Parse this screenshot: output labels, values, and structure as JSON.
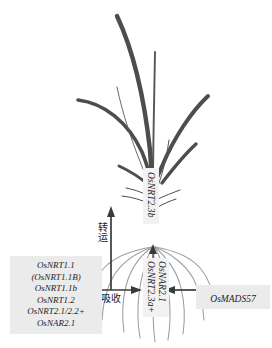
{
  "figure": {
    "colors": {
      "leaf_dark": "#4d4d4d",
      "leaf_thin": "#555555",
      "root_gray": "#9a9a9a",
      "arrow": "#3a3a3a",
      "label_bg": "#f2f2f2",
      "box_bg": "#ebebeb",
      "text": "#1d1d1d"
    }
  },
  "gene_box": {
    "name": "uptake-gene-list",
    "genes": [
      "OsNRT1.1",
      "(OsNRT1.1B)",
      "OsNRT1.1b",
      "OsNRT1.2",
      "OsNRT2.1/2.2+",
      "OsNAR2.1"
    ]
  },
  "regulator": {
    "label": "OsMADS57"
  },
  "shoot": {
    "label": "OsNRT2.3b"
  },
  "root": {
    "labels": [
      "OsNRT2.3a+",
      "OsNAR2.1"
    ]
  },
  "processes": {
    "transport": "转运",
    "uptake": "吸收"
  }
}
